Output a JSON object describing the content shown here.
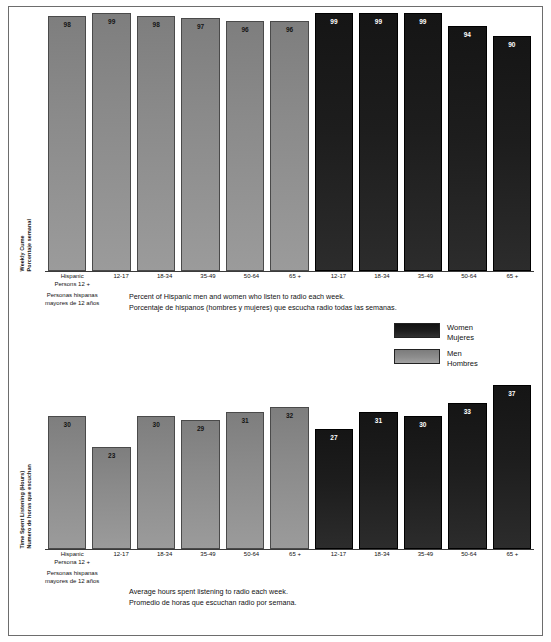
{
  "chart_data": [
    {
      "type": "bar",
      "title": "Weekly Cume / Porcentaje semanal",
      "ylabel_en": "Weekly Cume",
      "ylabel_es": "Porcentaje semanal",
      "xlabel": "",
      "ylim": [
        0,
        100
      ],
      "grid": false,
      "legend_position": "right-middle",
      "caption_en": "Percent of Hispanic men and women who listen to radio each week.",
      "caption_es": "Porcentaje de hispanos (hombres y mujeres) que escucha radio todas las semanas.",
      "categories": [
        "Hispanic Persons 12 +",
        "12-17",
        "18-34",
        "35-49",
        "50-64",
        "65 +",
        "12-17",
        "18-34",
        "35-49",
        "50-64",
        "65 +"
      ],
      "series": [
        {
          "name": "Men / Hombres",
          "categories": [
            "Hispanic Persons 12 +",
            "12-17",
            "18-34",
            "35-49",
            "50-64",
            "65 +"
          ],
          "values": [
            98,
            99,
            98,
            97,
            96,
            96
          ]
        },
        {
          "name": "Women / Mujeres",
          "categories": [
            "12-17",
            "18-34",
            "35-49",
            "50-64",
            "65 +"
          ],
          "values": [
            99,
            99,
            99,
            94,
            90
          ]
        }
      ]
    },
    {
      "type": "bar",
      "title": "Time Spent Listening (Hours) / Numero de horas que escuchan",
      "ylabel_en": "Time Spent Listening (Hours)",
      "ylabel_es": "Numero de horas que escuchan",
      "xlabel": "",
      "ylim": [
        0,
        40
      ],
      "grid": false,
      "legend_position": "right-middle",
      "caption_en": "Average hours spent listening to radio each week.",
      "caption_es": "Promedio de horas que escuchan radio por semana.",
      "categories": [
        "Hispanic Persons 12 +",
        "12-17",
        "18-34",
        "35-49",
        "50-64",
        "65 +",
        "12-17",
        "18-34",
        "35-49",
        "50-64",
        "65 +"
      ],
      "series": [
        {
          "name": "Men / Hombres",
          "categories": [
            "Hispanic Persons 12 +",
            "12-17",
            "18-34",
            "35-49",
            "50-64",
            "65 +"
          ],
          "values": [
            30,
            23,
            30,
            29,
            31,
            32
          ]
        },
        {
          "name": "Women / Mujeres",
          "categories": [
            "12-17",
            "18-34",
            "35-49",
            "50-64",
            "65 +"
          ],
          "values": [
            27,
            31,
            30,
            33,
            37
          ]
        }
      ]
    }
  ],
  "colors": {
    "men": "#8a8a8a",
    "women": "#1d1d1d",
    "frame": "#6d6d6d",
    "axis": "#3b3b3b",
    "text": "#111111"
  },
  "top_chart": {
    "ylabel_en": "Weekly Cume",
    "ylabel_es": "Porcentaje semanal",
    "bars": [
      {
        "label": "98",
        "value": 98,
        "group": "men"
      },
      {
        "label": "99",
        "value": 99,
        "group": "men"
      },
      {
        "label": "98",
        "value": 98,
        "group": "men"
      },
      {
        "label": "97",
        "value": 97,
        "group": "men"
      },
      {
        "label": "96",
        "value": 96,
        "group": "men"
      },
      {
        "label": "96",
        "value": 96,
        "group": "men"
      },
      {
        "label": "99",
        "value": 99,
        "group": "women"
      },
      {
        "label": "99",
        "value": 99,
        "group": "women"
      },
      {
        "label": "99",
        "value": 99,
        "group": "women"
      },
      {
        "label": "94",
        "value": 94,
        "group": "women"
      },
      {
        "label": "90",
        "value": 90,
        "group": "women"
      }
    ],
    "xticks": [
      {
        "l1": "Hispanic",
        "l2": "Persons 12 +",
        "sub1": "Personas hispanas",
        "sub2": "mayores de 12 años"
      },
      {
        "l1": "12-17",
        "l2": "",
        "sub1": "",
        "sub2": ""
      },
      {
        "l1": "18-34",
        "l2": "",
        "sub1": "",
        "sub2": ""
      },
      {
        "l1": "35-49",
        "l2": "",
        "sub1": "",
        "sub2": ""
      },
      {
        "l1": "50-64",
        "l2": "",
        "sub1": "",
        "sub2": ""
      },
      {
        "l1": "65 +",
        "l2": "",
        "sub1": "",
        "sub2": ""
      },
      {
        "l1": "12-17",
        "l2": "",
        "sub1": "",
        "sub2": ""
      },
      {
        "l1": "18-34",
        "l2": "",
        "sub1": "",
        "sub2": ""
      },
      {
        "l1": "35-49",
        "l2": "",
        "sub1": "",
        "sub2": ""
      },
      {
        "l1": "50-64",
        "l2": "",
        "sub1": "",
        "sub2": ""
      },
      {
        "l1": "65 +",
        "l2": "",
        "sub1": "",
        "sub2": ""
      }
    ],
    "caption_en": "Percent of Hispanic men and women who listen to radio each week.",
    "caption_es": "Porcentaje de hispanos (hombres y mujeres) que escucha radio todas las semanas."
  },
  "bottom_chart": {
    "ylabel_en": "Time Spent Listening (Hours)",
    "ylabel_es": "Numero de horas que escuchan",
    "bars": [
      {
        "label": "30",
        "value": 30,
        "group": "men"
      },
      {
        "label": "23",
        "value": 23,
        "group": "men"
      },
      {
        "label": "30",
        "value": 30,
        "group": "men"
      },
      {
        "label": "29",
        "value": 29,
        "group": "men"
      },
      {
        "label": "31",
        "value": 31,
        "group": "men"
      },
      {
        "label": "32",
        "value": 32,
        "group": "men"
      },
      {
        "label": "27",
        "value": 27,
        "group": "women"
      },
      {
        "label": "31",
        "value": 31,
        "group": "women"
      },
      {
        "label": "30",
        "value": 30,
        "group": "women"
      },
      {
        "label": "33",
        "value": 33,
        "group": "women"
      },
      {
        "label": "37",
        "value": 37,
        "group": "women"
      }
    ],
    "xticks": [
      {
        "l1": "Hispanic",
        "l2": "Persona 12 +",
        "sub1": "Personas hispanas",
        "sub2": "mayores de 12 años"
      },
      {
        "l1": "12-17",
        "l2": "",
        "sub1": "",
        "sub2": ""
      },
      {
        "l1": "18-34",
        "l2": "",
        "sub1": "",
        "sub2": ""
      },
      {
        "l1": "35-49",
        "l2": "",
        "sub1": "",
        "sub2": ""
      },
      {
        "l1": "50-64",
        "l2": "",
        "sub1": "",
        "sub2": ""
      },
      {
        "l1": "65 +",
        "l2": "",
        "sub1": "",
        "sub2": ""
      },
      {
        "l1": "12-17",
        "l2": "",
        "sub1": "",
        "sub2": ""
      },
      {
        "l1": "18-34",
        "l2": "",
        "sub1": "",
        "sub2": ""
      },
      {
        "l1": "35-49",
        "l2": "",
        "sub1": "",
        "sub2": ""
      },
      {
        "l1": "50-64",
        "l2": "",
        "sub1": "",
        "sub2": ""
      },
      {
        "l1": "65 +",
        "l2": "",
        "sub1": "",
        "sub2": ""
      }
    ],
    "caption_en": "Average hours spent listening to radio each week.",
    "caption_es": "Promedio de horas que escuchan radio por semana."
  },
  "legend": {
    "items": [
      {
        "en": "Women",
        "es": "Mujeres",
        "group": "women"
      },
      {
        "en": "Men",
        "es": "Hombres",
        "group": "men"
      }
    ]
  }
}
